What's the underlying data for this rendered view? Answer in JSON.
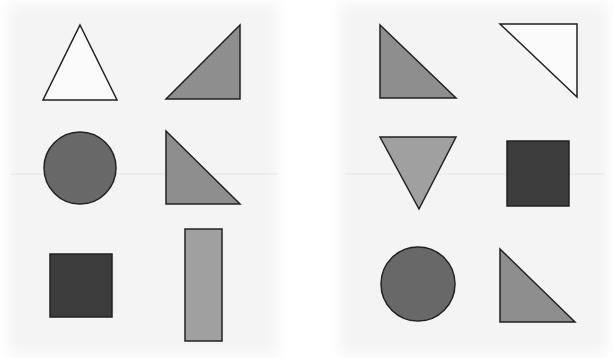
{
  "colors": {
    "white": "#fbfbfb",
    "light_gray": "#a0a0a0",
    "mid_gray": "#8e8e8e",
    "dark_gray": "#686868",
    "very_dark": "#3c3c3c",
    "stroke": "#222222"
  },
  "panels": [
    {
      "name": "left",
      "shapes": [
        {
          "type": "equilateral-triangle-up",
          "fill": "white",
          "row": 1,
          "col": 1
        },
        {
          "type": "right-triangle-right-angle-bottom-right",
          "fill": "mid_gray",
          "row": 1,
          "col": 2
        },
        {
          "type": "circle",
          "fill": "dark_gray",
          "row": 2,
          "col": 1
        },
        {
          "type": "right-triangle-right-angle-bottom-left",
          "fill": "mid_gray",
          "row": 2,
          "col": 2
        },
        {
          "type": "square",
          "fill": "very_dark",
          "row": 3,
          "col": 1
        },
        {
          "type": "tall-rectangle",
          "fill": "light_gray",
          "row": 3,
          "col": 2
        }
      ]
    },
    {
      "name": "right",
      "shapes": [
        {
          "type": "right-triangle-right-angle-bottom-left",
          "fill": "mid_gray",
          "row": 1,
          "col": 1
        },
        {
          "type": "right-triangle-right-angle-top-right",
          "fill": "white",
          "row": 1,
          "col": 2
        },
        {
          "type": "inverted-triangle",
          "fill": "light_gray",
          "row": 2,
          "col": 1
        },
        {
          "type": "square",
          "fill": "very_dark",
          "row": 2,
          "col": 2
        },
        {
          "type": "circle",
          "fill": "dark_gray",
          "row": 3,
          "col": 1
        },
        {
          "type": "right-triangle-right-angle-bottom-left",
          "fill": "mid_gray",
          "row": 3,
          "col": 2
        }
      ]
    }
  ]
}
